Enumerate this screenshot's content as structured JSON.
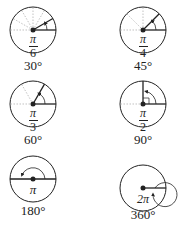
{
  "diagram": {
    "title": "",
    "angles": [
      {
        "degrees_label": "30°",
        "radian_numerator": "π",
        "radian_denominator": "6",
        "degrees": 30
      },
      {
        "degrees_label": "45°",
        "radian_numerator": "π",
        "radian_denominator": "4",
        "degrees": 45
      },
      {
        "degrees_label": "60°",
        "radian_numerator": "π",
        "radian_denominator": "3",
        "degrees": 60
      },
      {
        "degrees_label": "90°",
        "radian_numerator": "π",
        "radian_denominator": "2",
        "degrees": 90
      },
      {
        "degrees_label": "180°",
        "radian_label": "π",
        "degrees": 180
      },
      {
        "degrees_label": "360°",
        "radian_label": "2π",
        "degrees": 360
      }
    ],
    "colors": {
      "stroke": "#222222",
      "guides": "#999999",
      "background": "#ffffff"
    }
  }
}
